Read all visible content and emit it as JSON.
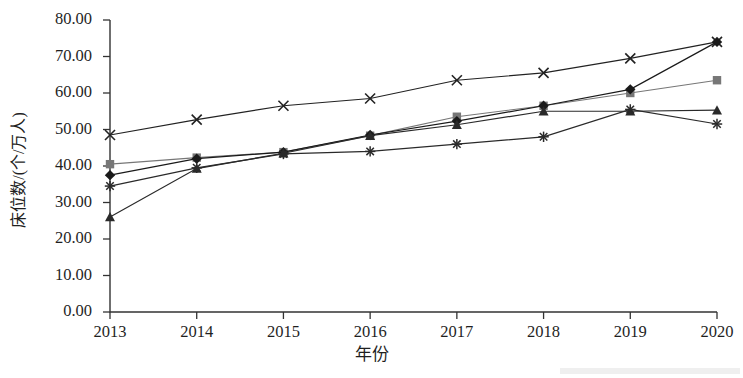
{
  "chart_data": {
    "type": "line",
    "title": "",
    "xlabel": "年份",
    "ylabel": "床位数/(个/万人)",
    "categories": [
      "2013",
      "2014",
      "2015",
      "2016",
      "2017",
      "2018",
      "2019",
      "2020"
    ],
    "x": [
      2013,
      2014,
      2015,
      2016,
      2017,
      2018,
      2019,
      2020
    ],
    "ylim": [
      0,
      80
    ],
    "xlim": [
      2013,
      2020
    ],
    "ytick_labels": [
      "80.00",
      "70.00",
      "60.00",
      "50.00",
      "40.00",
      "30.00",
      "20.00",
      "10.00",
      "0.00"
    ],
    "ytick_values": [
      80,
      70,
      60,
      50,
      40,
      30,
      20,
      10,
      0
    ],
    "grid": false,
    "legend": "none",
    "series": [
      {
        "name": "series-x-cross",
        "marker": "x-cross",
        "color": "#222222",
        "values": [
          48.5,
          52.7,
          56.5,
          58.5,
          63.5,
          65.5,
          69.5,
          74.0
        ]
      },
      {
        "name": "series-square",
        "marker": "square",
        "color": "#777777",
        "values": [
          40.5,
          42.3,
          43.8,
          48.3,
          53.5,
          56.5,
          60.0,
          63.5
        ]
      },
      {
        "name": "series-diamond",
        "marker": "diamond",
        "color": "#1a1a1a",
        "values": [
          37.5,
          42.0,
          43.8,
          48.5,
          52.3,
          56.5,
          61.0,
          74.0
        ]
      },
      {
        "name": "series-triangle",
        "marker": "triangle",
        "color": "#2a2a2a",
        "values": [
          26.0,
          39.3,
          43.5,
          48.3,
          51.3,
          55.0,
          55.0,
          55.3
        ]
      },
      {
        "name": "series-asterisk",
        "marker": "asterisk",
        "color": "#2a2a2a",
        "values": [
          34.5,
          39.5,
          43.3,
          44.0,
          46.0,
          48.0,
          55.5,
          51.5
        ]
      }
    ]
  },
  "axes": {
    "y_title": "床位数/(个/万人)",
    "x_title": "年份"
  }
}
